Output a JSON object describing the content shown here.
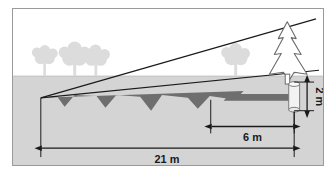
{
  "figure": {
    "scene": {
      "sky_color": "#ffffff",
      "ground_color": "#d4d4d4",
      "shadow_color": "#6e6e6e",
      "silhouette_tree_color": "#dcdcdc",
      "outline_color": "#1a1a1a",
      "frame_color": "#9a9a9a",
      "post_fill": "#f2f2f2"
    },
    "objects": {
      "pine_tree": {
        "name": "pine-tree",
        "tiers": 3,
        "fill": "#ffffff",
        "stroke": "#6b6b6b"
      },
      "measuring_post": {
        "name": "measuring-post",
        "height_label": "2 m"
      },
      "background_trees_left": 3,
      "background_trees_right": 1,
      "ground_shadow": {
        "name": "tree-shadow",
        "spikes": 4
      },
      "sight_lines": 2
    },
    "dimensions": [
      {
        "id": "total-shadow",
        "label": "21 m",
        "value": 21,
        "unit": "m",
        "orientation": "horizontal",
        "arrows": "both"
      },
      {
        "id": "post-shadow",
        "label": "6 m",
        "value": 6,
        "unit": "m",
        "orientation": "horizontal",
        "arrows": "both"
      },
      {
        "id": "post-height",
        "label": "2 m",
        "value": 2,
        "unit": "m",
        "orientation": "vertical",
        "arrows": "both"
      }
    ]
  }
}
